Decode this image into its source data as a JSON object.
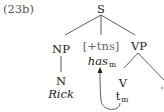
{
  "example_label": "(23b)",
  "tree": {
    "root": "S",
    "np": {
      "label": "NP",
      "child_label": "N",
      "word": "Rick"
    },
    "infl": {
      "feature": "[+tns]",
      "word": "has",
      "index": "m"
    },
    "vp": {
      "label": "VP",
      "child_label": "V",
      "trace": "t",
      "trace_index": "m"
    }
  },
  "movement_arrow": {
    "from": "t_m",
    "to": "has_m"
  }
}
